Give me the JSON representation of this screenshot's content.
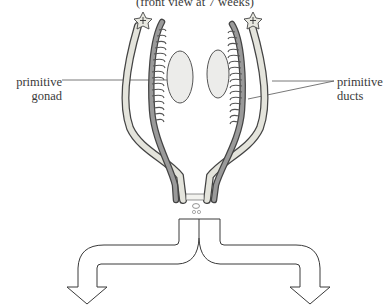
{
  "diagram": {
    "caption": "(front view at 7 weeks)",
    "labels": {
      "gonad": {
        "line1": "primitive",
        "line2": "gonad"
      },
      "ducts": {
        "line1": "primitive",
        "line2": "ducts"
      }
    },
    "structures": [
      "primitive gonad (left)",
      "primitive gonad (right)",
      "primitive ducts (left)",
      "primitive ducts (right)",
      "fimbriated ends",
      "urogenital opening"
    ],
    "branches": [
      "left arrow",
      "right arrow"
    ]
  },
  "colors": {
    "ink": "#3a3a3a",
    "duct_fill": "#e4e4dc",
    "gonad_fill": "#ececea",
    "tubule_fill": "#b8b8b8"
  }
}
